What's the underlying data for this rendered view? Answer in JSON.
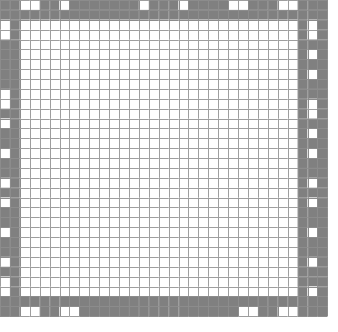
{
  "figure": {
    "type": "binary-cell-grid"
  },
  "canvas": {
    "width": 338,
    "height": 332,
    "background": "#ffffff"
  },
  "grid": {
    "cols": 33,
    "rows": 32,
    "origin_x": 0,
    "origin_y": 0,
    "cell_w": 9.92,
    "cell_h": 9.88,
    "line_width": 1.0,
    "line_color": "#8c8c8c",
    "fill_on": "#808080",
    "fill_off": "#ffffff",
    "interior_line_color": "#9a9a9a"
  },
  "colors": {
    "gray": "#808080",
    "white": "#ffffff",
    "gridline": "#8c8c8c",
    "interior_gridline": "#9e9e9e",
    "page_background": "#ffffff"
  },
  "structure": {
    "solid_ring_inset": 1,
    "edge_band_index": 0,
    "interior_start_col": 2,
    "interior_end_col": 30,
    "interior_start_row": 2,
    "interior_end_row": 29
  },
  "chart_data": {
    "type": "heatmap",
    "xlabel": "",
    "ylabel": "",
    "grid": true,
    "legend": "none",
    "cols": 33,
    "rows": 32,
    "value_map": {
      "0": "white",
      "1": "gray"
    },
    "cells": [
      [
        1,
        1,
        0,
        0,
        1,
        1,
        0,
        1,
        1,
        1,
        1,
        1,
        1,
        1,
        0,
        1,
        1,
        1,
        0,
        1,
        1,
        1,
        1,
        0,
        0,
        1,
        1,
        1,
        0,
        0,
        1,
        1,
        1
      ],
      [
        1,
        1,
        1,
        1,
        1,
        1,
        1,
        1,
        1,
        1,
        1,
        1,
        1,
        1,
        1,
        1,
        1,
        1,
        1,
        1,
        1,
        1,
        1,
        1,
        1,
        1,
        1,
        1,
        1,
        1,
        1,
        1,
        1
      ],
      [
        0,
        1,
        0,
        0,
        0,
        0,
        0,
        0,
        0,
        0,
        0,
        0,
        0,
        0,
        0,
        0,
        0,
        0,
        0,
        0,
        0,
        0,
        0,
        0,
        0,
        0,
        0,
        0,
        0,
        0,
        1,
        0,
        1
      ],
      [
        0,
        1,
        0,
        0,
        0,
        0,
        0,
        0,
        0,
        0,
        0,
        0,
        0,
        0,
        0,
        0,
        0,
        0,
        0,
        0,
        0,
        0,
        0,
        0,
        0,
        0,
        0,
        0,
        0,
        0,
        1,
        0,
        1
      ],
      [
        1,
        1,
        0,
        0,
        0,
        0,
        0,
        0,
        0,
        0,
        0,
        0,
        0,
        0,
        0,
        0,
        0,
        0,
        0,
        0,
        0,
        0,
        0,
        0,
        0,
        0,
        0,
        0,
        0,
        0,
        1,
        1,
        1
      ],
      [
        1,
        1,
        0,
        0,
        0,
        0,
        0,
        0,
        0,
        0,
        0,
        0,
        0,
        0,
        0,
        0,
        0,
        0,
        0,
        0,
        0,
        0,
        0,
        0,
        0,
        0,
        0,
        0,
        0,
        0,
        1,
        0,
        1
      ],
      [
        1,
        1,
        0,
        0,
        0,
        0,
        0,
        0,
        0,
        0,
        0,
        0,
        0,
        0,
        0,
        0,
        0,
        0,
        0,
        0,
        0,
        0,
        0,
        0,
        0,
        0,
        0,
        0,
        0,
        0,
        1,
        1,
        1
      ],
      [
        1,
        1,
        0,
        0,
        0,
        0,
        0,
        0,
        0,
        0,
        0,
        0,
        0,
        0,
        0,
        0,
        0,
        0,
        0,
        0,
        0,
        0,
        0,
        0,
        0,
        0,
        0,
        0,
        0,
        0,
        1,
        0,
        1
      ],
      [
        1,
        1,
        0,
        0,
        0,
        0,
        0,
        0,
        0,
        0,
        0,
        0,
        0,
        0,
        0,
        0,
        0,
        0,
        0,
        0,
        0,
        0,
        0,
        0,
        0,
        0,
        0,
        0,
        0,
        0,
        1,
        1,
        1
      ],
      [
        0,
        1,
        0,
        0,
        0,
        0,
        0,
        0,
        0,
        0,
        0,
        0,
        0,
        0,
        0,
        0,
        0,
        0,
        0,
        0,
        0,
        0,
        0,
        0,
        0,
        0,
        0,
        0,
        0,
        0,
        1,
        1,
        1
      ],
      [
        0,
        1,
        0,
        0,
        0,
        0,
        0,
        0,
        0,
        0,
        0,
        0,
        0,
        0,
        0,
        0,
        0,
        0,
        0,
        0,
        0,
        0,
        0,
        0,
        0,
        0,
        0,
        0,
        0,
        0,
        1,
        0,
        1
      ],
      [
        1,
        1,
        0,
        0,
        0,
        0,
        0,
        0,
        0,
        0,
        0,
        0,
        0,
        0,
        0,
        0,
        0,
        0,
        0,
        0,
        0,
        0,
        0,
        0,
        0,
        0,
        0,
        0,
        0,
        0,
        1,
        0,
        1
      ],
      [
        0,
        1,
        0,
        0,
        0,
        0,
        0,
        0,
        0,
        0,
        0,
        0,
        0,
        0,
        0,
        0,
        0,
        0,
        0,
        0,
        0,
        0,
        0,
        0,
        0,
        0,
        0,
        0,
        0,
        0,
        1,
        1,
        1
      ],
      [
        1,
        1,
        0,
        0,
        0,
        0,
        0,
        0,
        0,
        0,
        0,
        0,
        0,
        0,
        0,
        0,
        0,
        0,
        0,
        0,
        0,
        0,
        0,
        0,
        0,
        0,
        0,
        0,
        0,
        0,
        1,
        0,
        1
      ],
      [
        1,
        1,
        0,
        0,
        0,
        0,
        0,
        0,
        0,
        0,
        0,
        0,
        0,
        0,
        0,
        0,
        0,
        0,
        0,
        0,
        0,
        0,
        0,
        0,
        0,
        0,
        0,
        0,
        0,
        0,
        1,
        1,
        1
      ],
      [
        0,
        1,
        0,
        0,
        0,
        0,
        0,
        0,
        0,
        0,
        0,
        0,
        0,
        0,
        0,
        0,
        0,
        0,
        0,
        0,
        0,
        0,
        0,
        0,
        0,
        0,
        0,
        0,
        0,
        0,
        1,
        0,
        1
      ],
      [
        1,
        1,
        0,
        0,
        0,
        0,
        0,
        0,
        0,
        0,
        0,
        0,
        0,
        0,
        0,
        0,
        0,
        0,
        0,
        0,
        0,
        0,
        0,
        0,
        0,
        0,
        0,
        0,
        0,
        0,
        1,
        1,
        1
      ],
      [
        1,
        1,
        0,
        0,
        0,
        0,
        0,
        0,
        0,
        0,
        0,
        0,
        0,
        0,
        0,
        0,
        0,
        0,
        0,
        0,
        0,
        0,
        0,
        0,
        0,
        0,
        0,
        0,
        0,
        0,
        1,
        1,
        1
      ],
      [
        0,
        1,
        0,
        0,
        0,
        0,
        0,
        0,
        0,
        0,
        0,
        0,
        0,
        0,
        0,
        0,
        0,
        0,
        0,
        0,
        0,
        0,
        0,
        0,
        0,
        0,
        0,
        0,
        0,
        0,
        1,
        0,
        1
      ],
      [
        1,
        1,
        0,
        0,
        0,
        0,
        0,
        0,
        0,
        0,
        0,
        0,
        0,
        0,
        0,
        0,
        0,
        0,
        0,
        0,
        0,
        0,
        0,
        0,
        0,
        0,
        0,
        0,
        0,
        0,
        1,
        1,
        1
      ],
      [
        0,
        1,
        0,
        0,
        0,
        0,
        0,
        0,
        0,
        0,
        0,
        0,
        0,
        0,
        0,
        0,
        0,
        0,
        0,
        0,
        0,
        0,
        0,
        0,
        0,
        0,
        0,
        0,
        0,
        0,
        1,
        0,
        1
      ],
      [
        1,
        1,
        0,
        0,
        0,
        0,
        0,
        0,
        0,
        0,
        0,
        0,
        0,
        0,
        0,
        0,
        0,
        0,
        0,
        0,
        0,
        0,
        0,
        0,
        0,
        0,
        0,
        0,
        0,
        0,
        1,
        1,
        1
      ],
      [
        1,
        1,
        0,
        0,
        0,
        0,
        0,
        0,
        0,
        0,
        0,
        0,
        0,
        0,
        0,
        0,
        0,
        0,
        0,
        0,
        0,
        0,
        0,
        0,
        0,
        0,
        0,
        0,
        0,
        0,
        1,
        1,
        1
      ],
      [
        0,
        1,
        0,
        0,
        0,
        0,
        0,
        0,
        0,
        0,
        0,
        0,
        0,
        0,
        0,
        0,
        0,
        0,
        0,
        0,
        0,
        0,
        0,
        0,
        0,
        0,
        0,
        0,
        0,
        0,
        1,
        0,
        1
      ],
      [
        1,
        1,
        0,
        0,
        0,
        0,
        0,
        0,
        0,
        0,
        0,
        0,
        0,
        0,
        0,
        0,
        0,
        0,
        0,
        0,
        0,
        0,
        0,
        0,
        0,
        0,
        0,
        0,
        0,
        0,
        1,
        1,
        1
      ],
      [
        1,
        1,
        0,
        0,
        0,
        0,
        0,
        0,
        0,
        0,
        0,
        0,
        0,
        0,
        0,
        0,
        0,
        0,
        0,
        0,
        0,
        0,
        0,
        0,
        0,
        0,
        0,
        0,
        0,
        0,
        1,
        1,
        1
      ],
      [
        0,
        1,
        0,
        0,
        0,
        0,
        0,
        0,
        0,
        0,
        0,
        0,
        0,
        0,
        0,
        0,
        0,
        0,
        0,
        0,
        0,
        0,
        0,
        0,
        0,
        0,
        0,
        0,
        0,
        0,
        1,
        0,
        1
      ],
      [
        1,
        1,
        0,
        0,
        0,
        0,
        0,
        0,
        0,
        0,
        0,
        0,
        0,
        0,
        0,
        0,
        0,
        0,
        0,
        0,
        0,
        0,
        0,
        0,
        0,
        0,
        0,
        0,
        0,
        0,
        1,
        1,
        1
      ],
      [
        0,
        1,
        0,
        0,
        0,
        0,
        0,
        0,
        0,
        0,
        0,
        0,
        0,
        0,
        0,
        0,
        0,
        0,
        0,
        0,
        0,
        0,
        0,
        0,
        0,
        0,
        0,
        0,
        0,
        0,
        1,
        1,
        1
      ],
      [
        0,
        1,
        0,
        0,
        0,
        0,
        0,
        0,
        0,
        0,
        0,
        0,
        0,
        0,
        0,
        0,
        0,
        0,
        0,
        0,
        0,
        0,
        0,
        0,
        0,
        0,
        0,
        0,
        0,
        0,
        1,
        0,
        1
      ],
      [
        1,
        1,
        1,
        1,
        1,
        1,
        1,
        1,
        1,
        1,
        1,
        1,
        1,
        1,
        1,
        1,
        1,
        1,
        1,
        1,
        1,
        1,
        1,
        1,
        1,
        1,
        1,
        1,
        1,
        1,
        1,
        1,
        1
      ],
      [
        1,
        1,
        0,
        0,
        1,
        1,
        0,
        0,
        1,
        1,
        1,
        1,
        1,
        1,
        1,
        1,
        1,
        1,
        1,
        1,
        1,
        1,
        1,
        1,
        0,
        0,
        1,
        1,
        0,
        0,
        1,
        1,
        1
      ]
    ]
  }
}
